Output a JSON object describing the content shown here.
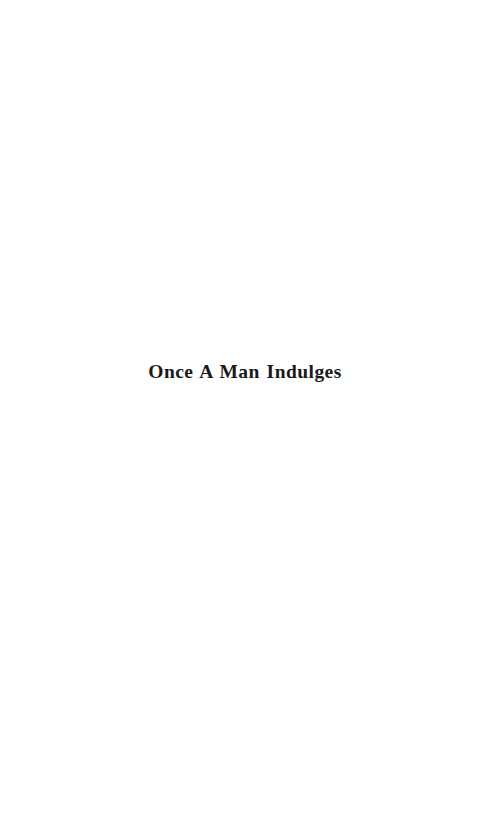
{
  "document": {
    "kind": "scanned-book-page",
    "page_background": "#ffffff",
    "ink_color": "#1a1a1a",
    "title_block": {
      "title": "Once A Man Indulges"
    }
  }
}
